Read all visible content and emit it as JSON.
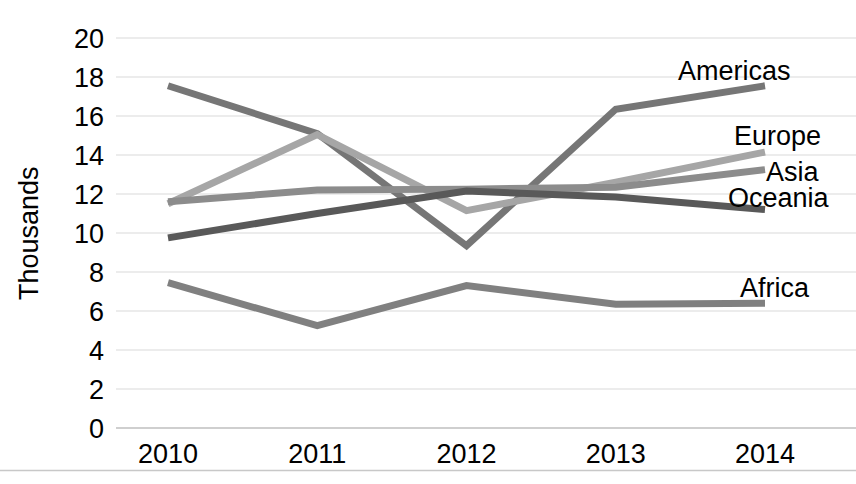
{
  "chart_data": {
    "type": "line",
    "title": "",
    "xlabel": "",
    "ylabel": "Thousands",
    "categories": [
      "2010",
      "2011",
      "2012",
      "2013",
      "2014"
    ],
    "x": [
      2010,
      2011,
      2012,
      2013,
      2014
    ],
    "ylim": [
      0,
      20
    ],
    "ytick_step": 2,
    "yticks": [
      "0",
      "2",
      "4",
      "6",
      "8",
      "10",
      "12",
      "14",
      "16",
      "18",
      "20"
    ],
    "grid": true,
    "legend_position": "inline-right-of-line-ends",
    "series": [
      {
        "name": "Americas",
        "color": "#767676",
        "values": [
          17.55,
          15.1,
          9.35,
          16.35,
          17.55
        ]
      },
      {
        "name": "Europe",
        "color": "#a6a6a6",
        "values": [
          11.5,
          15.05,
          11.15,
          12.6,
          14.15
        ]
      },
      {
        "name": "Asia",
        "color": "#8c8c8c",
        "values": [
          11.6,
          12.2,
          12.25,
          12.35,
          13.25
        ]
      },
      {
        "name": "Oceania",
        "color": "#595959",
        "values": [
          9.75,
          11.0,
          12.15,
          11.85,
          11.2
        ]
      },
      {
        "name": "Africa",
        "color": "#808080",
        "values": [
          7.45,
          5.25,
          7.3,
          6.35,
          6.4
        ]
      }
    ]
  },
  "axis": {
    "y_title": "Thousands"
  },
  "labels": {
    "americas": "Americas",
    "europe": "Europe",
    "asia": "Asia",
    "oceania": "Oceania",
    "africa": "Africa"
  }
}
